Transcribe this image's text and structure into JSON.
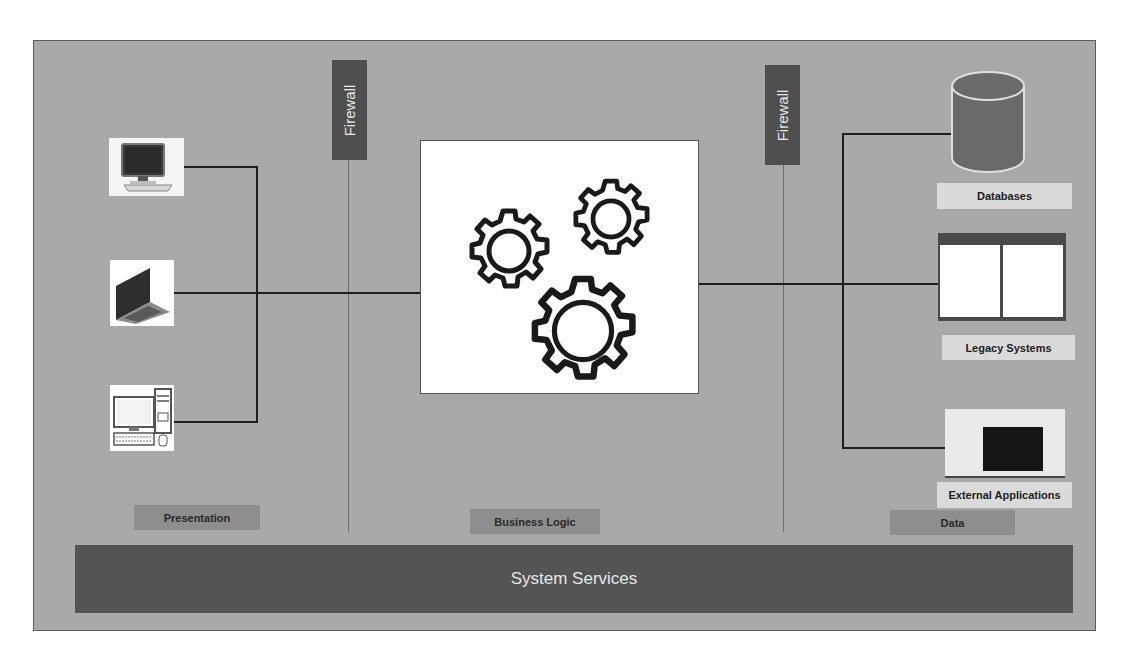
{
  "diagram": {
    "type": "three-tier architecture",
    "firewalls": [
      {
        "label": "Firewall",
        "position": "between presentation and business logic"
      },
      {
        "label": "Firewall",
        "position": "between business logic and data"
      }
    ],
    "presentation": {
      "tier_label": "Presentation",
      "devices": [
        {
          "name": "monitor-workstation",
          "icon": "monitor-icon"
        },
        {
          "name": "laptop",
          "icon": "laptop-icon"
        },
        {
          "name": "desktop-computer",
          "icon": "desktop-computer-icon"
        }
      ]
    },
    "business_logic": {
      "tier_label": "Business Logic",
      "icon": "gears-icon"
    },
    "data": {
      "tier_label": "Data",
      "items": [
        {
          "label": "Databases",
          "icon": "database-cylinder-icon"
        },
        {
          "label": "Legacy Systems",
          "icon": "legacy-window-icon"
        },
        {
          "label": "External Applications",
          "icon": "terminal-window-icon"
        }
      ]
    },
    "system_services": {
      "label": "System Services"
    },
    "colors": {
      "background": "#a9a9a9",
      "firewall": "#4f4f4f",
      "services_bar": "#545454",
      "tier_label": "#8e8e8e",
      "item_label": "#dadada",
      "connector": "#1e1e1e"
    }
  }
}
